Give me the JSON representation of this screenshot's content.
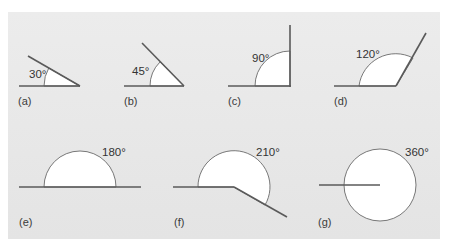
{
  "figure": {
    "background_color": "#e8e8e8",
    "line_color": "#5a5a5a",
    "fill_color": "#ffffff",
    "panels": [
      {
        "id": "a",
        "label": "(a)",
        "angle": "30°"
      },
      {
        "id": "b",
        "label": "(b)",
        "angle": "45°"
      },
      {
        "id": "c",
        "label": "(c)",
        "angle": "90°"
      },
      {
        "id": "d",
        "label": "(d)",
        "angle": "120°"
      },
      {
        "id": "e",
        "label": "(e)",
        "angle": "180°"
      },
      {
        "id": "f",
        "label": "(f)",
        "angle": "210°"
      },
      {
        "id": "g",
        "label": "(g)",
        "angle": "360°"
      }
    ]
  }
}
